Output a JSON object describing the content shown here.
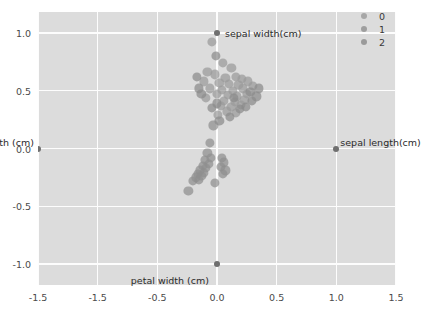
{
  "chart_data": {
    "type": "scatter",
    "title": "",
    "xlabel": "",
    "ylabel": "",
    "xlim": [
      -1.5,
      1.5
    ],
    "ylim": [
      -1.18,
      1.18
    ],
    "grid": true,
    "xticks": [
      -1.5,
      -1.5,
      -0.5,
      0.0,
      0.5,
      1.0,
      1.5
    ],
    "xticklabels": [
      "-1.5",
      "-1.5",
      "-0.5",
      "0.0",
      "0.5",
      "1.0",
      "1.5"
    ],
    "xtick_positions": [
      -1.5,
      -1.0,
      -0.5,
      0.0,
      0.5,
      1.0,
      1.5
    ],
    "yticks": [
      1.0,
      0.5,
      0.0,
      -0.5,
      -1.0
    ],
    "yticklabels": [
      "1.0",
      "0.5",
      "0.0",
      "-0.5",
      "-1.0"
    ],
    "legend": {
      "position": "upper right",
      "entries": [
        {
          "label": "0",
          "color": "#9a9a9a"
        },
        {
          "label": "1",
          "color": "#8f8f8f"
        },
        {
          "label": "2",
          "color": "#8a8a8a"
        }
      ]
    },
    "annotations": [
      {
        "text": "sepal width(cm)",
        "x": 0.0,
        "y": 1.0,
        "dx": 8,
        "dy": -5
      },
      {
        "text": "sepal length(cm)",
        "x": 1.0,
        "y": 0.0,
        "dx": 4,
        "dy": -12
      },
      {
        "text": "petal length (cm)",
        "x": -1.5,
        "y": 0.0,
        "dx": -4,
        "dy": -12
      },
      {
        "text": "petal width (cm)",
        "x": 0.0,
        "y": -1.0,
        "dx": -8,
        "dy": 11
      }
    ],
    "anchor_points": [
      {
        "label": "sepal width(cm)",
        "x": 0.0,
        "y": 1.0
      },
      {
        "label": "sepal length(cm)",
        "x": 1.0,
        "y": 0.0
      },
      {
        "label": "petal length (cm)",
        "x": -1.5,
        "y": 0.0
      },
      {
        "label": "petal width (cm)",
        "x": 0.0,
        "y": -1.0
      }
    ],
    "series": [
      {
        "name": "0",
        "color": "#9a9a9a",
        "points": [
          [
            -0.04,
            0.92
          ],
          [
            0.05,
            0.74
          ],
          [
            -0.08,
            0.66
          ],
          [
            0.12,
            0.7
          ],
          [
            -0.02,
            0.64
          ],
          [
            0.07,
            0.61
          ],
          [
            0.16,
            0.62
          ],
          [
            0.21,
            0.6
          ],
          [
            -0.11,
            0.58
          ],
          [
            0.02,
            0.57
          ],
          [
            0.1,
            0.56
          ],
          [
            0.18,
            0.55
          ],
          [
            0.26,
            0.58
          ],
          [
            -0.06,
            0.52
          ],
          [
            0.04,
            0.51
          ],
          [
            0.13,
            0.5
          ],
          [
            0.22,
            0.52
          ],
          [
            0.3,
            0.54
          ],
          [
            0.0,
            0.47
          ],
          [
            0.09,
            0.46
          ],
          [
            0.17,
            0.45
          ],
          [
            0.25,
            0.47
          ],
          [
            -0.09,
            0.44
          ],
          [
            0.06,
            0.41
          ],
          [
            0.15,
            0.4
          ],
          [
            0.23,
            0.42
          ],
          [
            0.03,
            0.37
          ],
          [
            0.12,
            0.36
          ],
          [
            0.2,
            0.38
          ],
          [
            0.08,
            0.32
          ],
          [
            0.16,
            0.31
          ],
          [
            0.01,
            0.29
          ]
        ]
      },
      {
        "name": "1",
        "color": "#8f8f8f",
        "points": [
          [
            -0.03,
            0.2
          ],
          [
            -0.06,
            0.05
          ],
          [
            -0.08,
            -0.04
          ],
          [
            -0.05,
            -0.08
          ],
          [
            -0.1,
            -0.1
          ],
          [
            -0.07,
            -0.13
          ],
          [
            -0.12,
            -0.15
          ],
          [
            -0.09,
            -0.17
          ],
          [
            -0.14,
            -0.19
          ],
          [
            -0.11,
            -0.21
          ],
          [
            -0.16,
            -0.22
          ],
          [
            -0.13,
            -0.24
          ],
          [
            -0.18,
            -0.25
          ],
          [
            -0.15,
            -0.27
          ],
          [
            -0.2,
            -0.28
          ],
          [
            0.04,
            -0.08
          ],
          [
            0.06,
            -0.12
          ],
          [
            0.03,
            -0.16
          ],
          [
            0.07,
            -0.19
          ],
          [
            0.05,
            -0.22
          ],
          [
            -0.02,
            -0.3
          ],
          [
            -0.24,
            -0.37
          ]
        ]
      },
      {
        "name": "2",
        "color": "#8a8a8a",
        "points": [
          [
            0.28,
            0.49
          ],
          [
            0.33,
            0.45
          ],
          [
            0.19,
            0.34
          ],
          [
            0.11,
            0.27
          ],
          [
            0.02,
            0.24
          ],
          [
            -0.15,
            0.52
          ],
          [
            -0.13,
            0.47
          ],
          [
            0.35,
            0.52
          ],
          [
            0.24,
            0.36
          ],
          [
            0.0,
            0.39
          ],
          [
            -0.04,
            0.35
          ],
          [
            0.29,
            0.41
          ],
          [
            0.14,
            0.44
          ],
          [
            -0.17,
            0.62
          ],
          [
            -0.01,
            0.8
          ]
        ]
      }
    ]
  }
}
